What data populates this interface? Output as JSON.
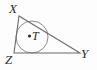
{
  "figure": {
    "name": "triangle-with-inscribed-circle",
    "width": 97,
    "height": 70,
    "background_color": "#fdfdfd",
    "stroke_color": "#6e6e6e",
    "label_color": "#2b2b2b"
  },
  "labels": {
    "vertex_x": "X",
    "vertex_y": "Y",
    "vertex_z": "Z",
    "center_t": "T"
  },
  "geometry": {
    "triangle": {
      "vertices": [
        {
          "name": "X",
          "x": 19,
          "y": 16
        },
        {
          "name": "Y",
          "x": 80,
          "y": 53
        },
        {
          "name": "Z",
          "x": 14,
          "y": 53
        }
      ],
      "edges": [
        {
          "name": "XY",
          "from": "X",
          "to": "Y"
        },
        {
          "name": "YZ",
          "from": "Y",
          "to": "Z"
        },
        {
          "name": "ZX",
          "from": "Z",
          "to": "X"
        }
      ]
    },
    "incircle": {
      "center": {
        "x": 32,
        "y": 37
      },
      "radius": 16
    },
    "center_dot": {
      "x": 29.5,
      "y": 36,
      "radius": 1.6
    }
  }
}
